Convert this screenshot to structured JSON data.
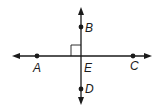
{
  "diagram": {
    "type": "perpendicular-lines",
    "colors": {
      "stroke": "#1a1a1a",
      "background": "#ffffff"
    },
    "lines": [
      {
        "name": "line-AC",
        "through": [
          "A",
          "E",
          "C"
        ],
        "orientation": "horizontal",
        "arrows": "both"
      },
      {
        "name": "line-BD",
        "through": [
          "B",
          "E",
          "D"
        ],
        "orientation": "vertical",
        "arrows": "both"
      }
    ],
    "right_angle_marker": {
      "at": "E",
      "quadrant": "upper-left"
    },
    "points": [
      {
        "label": "A",
        "x": 37,
        "y": 56,
        "dot": true
      },
      {
        "label": "B",
        "x": 81,
        "y": 27,
        "dot": true
      },
      {
        "label": "C",
        "x": 133,
        "y": 56,
        "dot": true
      },
      {
        "label": "D",
        "x": 81,
        "y": 89,
        "dot": true
      },
      {
        "label": "E",
        "x": 81,
        "y": 56,
        "dot": false
      }
    ],
    "labels": {
      "A": "A",
      "B": "B",
      "C": "C",
      "D": "D",
      "E": "E"
    }
  }
}
